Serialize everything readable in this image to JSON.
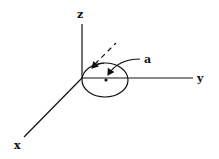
{
  "diagram": {
    "axes": {
      "z_label": "z",
      "y_label": "y",
      "x_label": "x"
    },
    "annotation_label": "a",
    "colors": {
      "stroke": "#111111",
      "background": "#ffffff"
    }
  }
}
